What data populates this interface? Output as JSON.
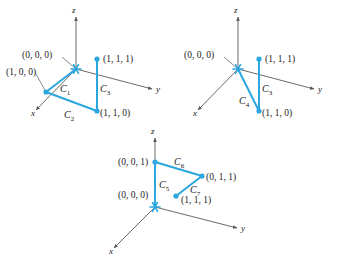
{
  "figure": {
    "type": "math-diagram",
    "accent_color": "#2BA6DE",
    "axis_color": "#595959",
    "text_color": "#1a1a1a"
  },
  "axis_labels": {
    "x": "x",
    "y": "y",
    "z": "z"
  },
  "panels": [
    {
      "id": "panel-1",
      "origin_px": [
        76,
        69
      ],
      "axes": {
        "z_tip": [
          76,
          17
        ],
        "y_tip": [
          152,
          89
        ],
        "x_tip": [
          36,
          110
        ]
      },
      "axis_label_pos": {
        "z": [
          72,
          13
        ],
        "y": [
          156,
          92
        ],
        "x": [
          31,
          116
        ]
      },
      "coord_labels": [
        {
          "name": "origin",
          "text": "(0, 0, 0)",
          "x": 22,
          "y": 58,
          "anchor": "start"
        },
        {
          "name": "point-100",
          "text": "(1, 0, 0)",
          "x": 6,
          "y": 75,
          "anchor": "start"
        },
        {
          "name": "point-111",
          "text": "(1, 1, 1)",
          "x": 103,
          "y": 62,
          "anchor": "start"
        },
        {
          "name": "point-110",
          "text": "(1, 1, 0)",
          "x": 100,
          "y": 116,
          "anchor": "start"
        }
      ],
      "vertices": [
        {
          "name": "vertex-100",
          "x": 46,
          "y": 92
        },
        {
          "name": "vertex-110",
          "x": 97,
          "y": 111
        },
        {
          "name": "vertex-111",
          "x": 97,
          "y": 59
        }
      ],
      "leaders": [
        {
          "name": "leader-origin",
          "x1": 62,
          "y1": 57,
          "x2": 76,
          "y2": 69
        },
        {
          "name": "leader-100",
          "x1": 36,
          "y1": 74,
          "x2": 46,
          "y2": 92
        }
      ],
      "curves": [
        {
          "name": "curve-c1",
          "label": "C",
          "subscript": "1",
          "from": "(0, 0, 0)",
          "to": "(1, 0, 0)",
          "path": "M 76 69 L 46 92",
          "label_pos": [
            60,
            92
          ]
        },
        {
          "name": "curve-c2",
          "label": "C",
          "subscript": "2",
          "from": "(1, 0, 0)",
          "to": "(1, 1, 0)",
          "path": "M 46 92 L 97 111",
          "label_pos": [
            64,
            118
          ]
        },
        {
          "name": "curve-c3",
          "label": "C",
          "subscript": "3",
          "from": "(1, 1, 0)",
          "to": "(1, 1, 1)",
          "path": "M 97 111 L 97 59",
          "label_pos": [
            100,
            92
          ]
        }
      ]
    },
    {
      "id": "panel-2",
      "origin_px": [
        238,
        69
      ],
      "axes": {
        "z_tip": [
          238,
          17
        ],
        "y_tip": [
          314,
          89
        ],
        "x_tip": [
          198,
          110
        ]
      },
      "axis_label_pos": {
        "z": [
          234,
          13
        ],
        "y": [
          318,
          92
        ],
        "x": [
          193,
          116
        ]
      },
      "coord_labels": [
        {
          "name": "origin",
          "text": "(0, 0, 0)",
          "x": 184,
          "y": 58,
          "anchor": "start"
        },
        {
          "name": "point-111",
          "text": "(1, 1, 1)",
          "x": 265,
          "y": 62,
          "anchor": "start"
        },
        {
          "name": "point-110",
          "text": "(1, 1, 0)",
          "x": 262,
          "y": 116,
          "anchor": "start"
        }
      ],
      "vertices": [
        {
          "name": "vertex-110",
          "x": 259,
          "y": 111
        },
        {
          "name": "vertex-111",
          "x": 259,
          "y": 59
        }
      ],
      "leaders": [
        {
          "name": "leader-origin",
          "x1": 224,
          "y1": 57,
          "x2": 238,
          "y2": 69
        }
      ],
      "curves": [
        {
          "name": "curve-c4",
          "label": "C",
          "subscript": "4",
          "from": "(0, 0, 0)",
          "to": "(1, 1, 0)",
          "path": "M 238 69 L 259 111",
          "label_pos": [
            239,
            104
          ]
        },
        {
          "name": "curve-c3",
          "label": "C",
          "subscript": "3",
          "from": "(1, 1, 0)",
          "to": "(1, 1, 1)",
          "path": "M 259 111 L 259 59",
          "label_pos": [
            262,
            92
          ]
        }
      ]
    },
    {
      "id": "panel-3",
      "origin_px": [
        155,
        207
      ],
      "axes": {
        "z_tip": [
          155,
          138
        ],
        "y_tip": [
          237,
          228
        ],
        "x_tip": [
          114,
          248
        ]
      },
      "axis_label_pos": {
        "z": [
          151,
          134
        ],
        "y": [
          241,
          231
        ],
        "x": [
          109,
          254
        ]
      },
      "coord_labels": [
        {
          "name": "point-001",
          "text": "(0, 0, 1)",
          "x": 118,
          "y": 165,
          "anchor": "start"
        },
        {
          "name": "origin",
          "text": "(0, 0, 0)",
          "x": 118,
          "y": 198,
          "anchor": "start"
        },
        {
          "name": "point-011",
          "text": "(0, 1, 1)",
          "x": 206,
          "y": 180,
          "anchor": "start"
        },
        {
          "name": "point-111",
          "text": "(1, 1, 1)",
          "x": 181,
          "y": 203,
          "anchor": "start"
        }
      ],
      "vertices": [
        {
          "name": "vertex-001",
          "x": 155,
          "y": 162
        },
        {
          "name": "vertex-011",
          "x": 202,
          "y": 176
        },
        {
          "name": "vertex-111",
          "x": 176,
          "y": 196
        }
      ],
      "leaders": [],
      "curves": [
        {
          "name": "curve-c5",
          "label": "C",
          "subscript": "5",
          "from": "(0, 0, 0)",
          "to": "(0, 0, 1)",
          "path": "M 155 207 L 155 162",
          "label_pos": [
            159,
            188
          ]
        },
        {
          "name": "curve-c6",
          "label": "C",
          "subscript": "6",
          "from": "(0, 0, 1)",
          "to": "(0, 1, 1)",
          "path": "M 155 162 L 202 176",
          "label_pos": [
            174,
            165
          ]
        },
        {
          "name": "curve-c7",
          "label": "C",
          "subscript": "7",
          "from": "(0, 1, 1)",
          "to": "(1, 1, 1)",
          "path": "M 202 176 L 176 196",
          "label_pos": [
            190,
            193
          ]
        }
      ]
    }
  ]
}
